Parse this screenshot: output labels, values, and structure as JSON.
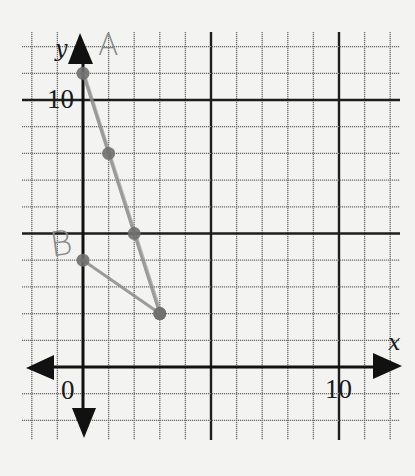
{
  "chart_data": {
    "type": "line",
    "title": "",
    "xlabel": "x",
    "ylabel": "y",
    "xlim": [
      -2,
      12
    ],
    "ylim": [
      -2,
      12
    ],
    "grid": true,
    "major_grid_every": 5,
    "tick_labels": {
      "origin": "0",
      "x": [
        {
          "value": 10,
          "label": "10"
        }
      ],
      "y": [
        {
          "value": 10,
          "label": "10"
        }
      ]
    },
    "series": [
      {
        "name": "A",
        "points": [
          {
            "x": 0,
            "y": 11
          },
          {
            "x": 1,
            "y": 8
          },
          {
            "x": 2,
            "y": 5
          },
          {
            "x": 3,
            "y": 2
          }
        ],
        "equation": "y = 11 - 3x"
      },
      {
        "name": "B",
        "points": [
          {
            "x": 0,
            "y": 4
          },
          {
            "x": 3,
            "y": 2
          }
        ],
        "equation": "y = 4 - (2/3)x"
      }
    ]
  },
  "labels": {
    "x_axis": "x",
    "y_axis": "y",
    "origin": "0",
    "x_ten": "10",
    "y_ten": "10",
    "line_a": "A",
    "line_b": "B"
  },
  "colors": {
    "paper": "#f3f3f1",
    "grid_minor": "#6e6e6e",
    "grid_major": "#1e1e1e",
    "axis": "#111111",
    "pencil": "#8c8c8c",
    "pencil_dot": "#6f6f6f"
  }
}
